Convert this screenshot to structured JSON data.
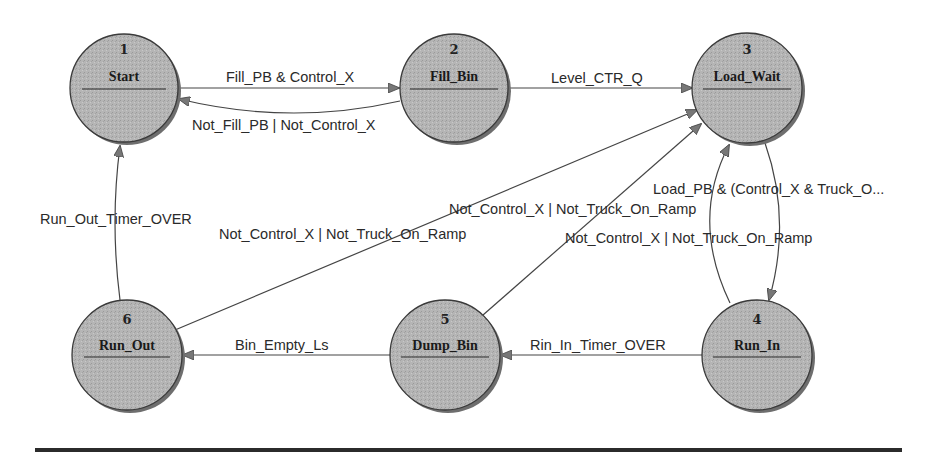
{
  "diagram": {
    "type": "state-machine",
    "colors": {
      "node_fill": "#b5b5b5",
      "node_shadow": "#6e6e6e",
      "node_stroke": "#3a3a3a",
      "edge": "#444444",
      "arrowhead": "#777777",
      "rule": "#2b2b2b"
    },
    "states": [
      {
        "id": 1,
        "number": "1",
        "name": "Start",
        "cx": 124,
        "cy": 88
      },
      {
        "id": 2,
        "number": "2",
        "name": "Fill_Bin",
        "cx": 454,
        "cy": 88
      },
      {
        "id": 3,
        "number": "3",
        "name": "Load_Wait",
        "cx": 747,
        "cy": 88
      },
      {
        "id": 4,
        "number": "4",
        "name": "Run_In",
        "cx": 757,
        "cy": 355
      },
      {
        "id": 5,
        "number": "5",
        "name": "Dump_Bin",
        "cx": 445,
        "cy": 355
      },
      {
        "id": 6,
        "number": "6",
        "name": "Run_Out",
        "cx": 127,
        "cy": 355
      }
    ],
    "transitions": [
      {
        "from": 1,
        "to": 2,
        "label": "Fill_PB & Control_X"
      },
      {
        "from": 2,
        "to": 1,
        "label": "Not_Fill_PB | Not_Control_X"
      },
      {
        "from": 2,
        "to": 3,
        "label": "Level_CTR_Q"
      },
      {
        "from": 3,
        "to": 4,
        "label": "Load_PB & (Control_X & Truck_O..."
      },
      {
        "from": 4,
        "to": 3,
        "label": "Not_Control_X | Not_Truck_On_Ramp"
      },
      {
        "from": 4,
        "to": 5,
        "label": "Rin_In_Timer_OVER"
      },
      {
        "from": 5,
        "to": 3,
        "label": "Not_Control_X | Not_Truck_On_Ramp"
      },
      {
        "from": 5,
        "to": 6,
        "label": "Bin_Empty_Ls"
      },
      {
        "from": 6,
        "to": 3,
        "label": "Not_Control_X | Not_Truck_On_Ramp"
      },
      {
        "from": 6,
        "to": 1,
        "label": "Run_Out_Timer_OVER"
      }
    ]
  }
}
